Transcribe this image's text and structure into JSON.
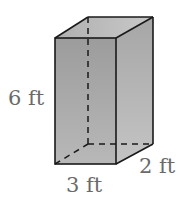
{
  "figure": {
    "type": "rectangular-prism",
    "labels": {
      "height": "6 ft",
      "width": "3 ft",
      "depth": "2 ft"
    },
    "dimensions": {
      "height_ft": 6,
      "width_ft": 3,
      "depth_ft": 2
    },
    "colors": {
      "front_face": "#a8a8a8",
      "side_face": "#b4b4b4",
      "top_face": "#bcbcbc",
      "edge": "#1a1a1a",
      "label": "#6a6a6a"
    }
  }
}
